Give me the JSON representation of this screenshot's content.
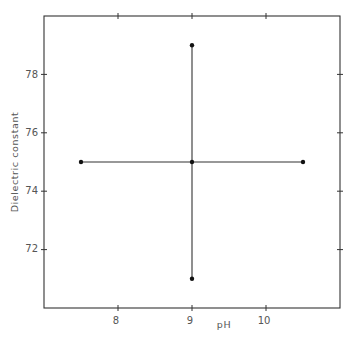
{
  "chart_data": {
    "type": "scatter",
    "title": "",
    "xlabel": "pH",
    "ylabel": "Dielectric constant",
    "xlim": [
      7,
      11
    ],
    "ylim": [
      70,
      80
    ],
    "x_ticks": [
      8,
      9,
      10
    ],
    "x_tick_labels": [
      "8",
      "9",
      "10"
    ],
    "y_ticks": [
      72,
      74,
      76,
      78
    ],
    "y_tick_labels": [
      "72",
      "74",
      "76",
      "78"
    ],
    "grid": false,
    "legend": null,
    "frame": "box with ticks on all four sides",
    "series": [
      {
        "name": "central point with range bars",
        "points": [
          {
            "x": 9.0,
            "y": 75.0,
            "role": "center"
          },
          {
            "x": 7.5,
            "y": 75.0,
            "role": "pH-low"
          },
          {
            "x": 10.5,
            "y": 75.0,
            "role": "pH-high"
          },
          {
            "x": 9.0,
            "y": 79.0,
            "role": "dielectric-high"
          },
          {
            "x": 9.0,
            "y": 71.0,
            "role": "dielectric-low"
          }
        ],
        "horizontal_bar": {
          "x_from": 7.5,
          "x_to": 10.5,
          "y": 75.0
        },
        "vertical_bar": {
          "x": 9.0,
          "y_from": 71.0,
          "y_to": 79.0
        }
      }
    ]
  },
  "labels": {
    "x_axis": "pH",
    "y_axis": "Dielectric constant",
    "x_ticks": [
      "8",
      "9",
      "10"
    ],
    "y_ticks": [
      "78",
      "76",
      "74",
      "72"
    ]
  }
}
